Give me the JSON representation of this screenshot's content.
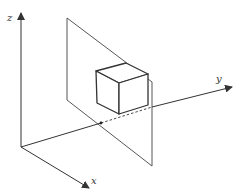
{
  "diagram": {
    "axes": {
      "x_label": "x",
      "y_label": "y",
      "z_label": "z"
    },
    "colors": {
      "stroke": "#333333",
      "background": "#ffffff"
    }
  }
}
